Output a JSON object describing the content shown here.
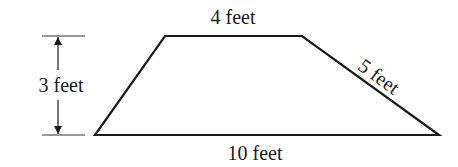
{
  "figure": {
    "shape": "trapezoid",
    "stroke_color": "#1a1a1a",
    "background": "#ffffff",
    "labels": {
      "top": "4 feet",
      "height": "3 feet",
      "slant_side": "5 feet",
      "bottom": "10 feet"
    },
    "measurements": {
      "top_base_ft": 4,
      "bottom_base_ft": 10,
      "height_ft": 3,
      "right_side_ft": 5
    }
  }
}
